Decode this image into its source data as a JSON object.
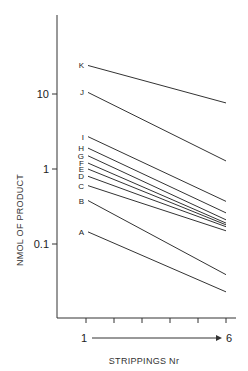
{
  "chart_data": {
    "type": "line",
    "title": "",
    "xlabel": "STRIPPINGS Nr",
    "ylabel": "NMOL OF PRODUCT",
    "y_scale": "log",
    "ylim": [
      0.012,
      100
    ],
    "y_ticks": [
      {
        "value": 10,
        "label": "10"
      },
      {
        "value": 1,
        "label": "1"
      },
      {
        "value": 0.1,
        "label": "0.1"
      }
    ],
    "x_ticks": [
      1,
      2,
      3,
      4,
      5,
      6
    ],
    "x_tick_labels": {
      "start": "1",
      "end": "6"
    },
    "x_arrow": true,
    "grid": false,
    "legend": "inline labels at left end of each line",
    "x": [
      1,
      6
    ],
    "series": [
      {
        "name": "K",
        "values": [
          24,
          7.6
        ]
      },
      {
        "name": "J",
        "values": [
          10.5,
          1.28
        ]
      },
      {
        "name": "I",
        "values": [
          2.7,
          0.37
        ]
      },
      {
        "name": "H",
        "values": [
          1.9,
          0.26
        ]
      },
      {
        "name": "G",
        "values": [
          1.5,
          0.21
        ]
      },
      {
        "name": "F",
        "values": [
          1.2,
          0.19
        ]
      },
      {
        "name": "E",
        "values": [
          1.0,
          0.18
        ]
      },
      {
        "name": "D",
        "values": [
          0.8,
          0.17
        ]
      },
      {
        "name": "C",
        "values": [
          0.6,
          0.15
        ]
      },
      {
        "name": "B",
        "values": [
          0.38,
          0.039
        ]
      },
      {
        "name": "A",
        "values": [
          0.145,
          0.023
        ]
      }
    ]
  }
}
